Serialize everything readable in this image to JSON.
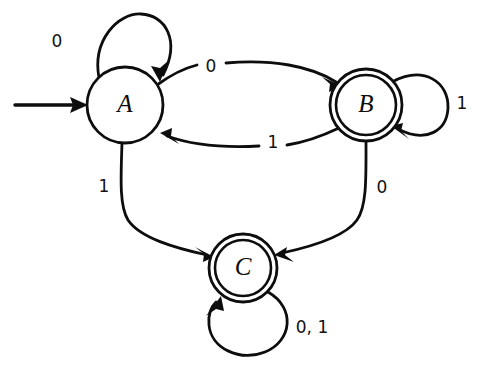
{
  "diagram": {
    "kind": "finite-state-machine",
    "alphabet": [
      "0",
      "1"
    ],
    "start_state": "A",
    "accepting_states": [
      "B",
      "C"
    ],
    "states": [
      {
        "id": "A",
        "label": "A",
        "accepting": false,
        "cx": 125,
        "cy": 105,
        "r": 38
      },
      {
        "id": "B",
        "label": "B",
        "accepting": true,
        "cx": 366,
        "cy": 105,
        "r": 36,
        "r_inner": 30
      },
      {
        "id": "C",
        "label": "C",
        "accepting": true,
        "cx": 243,
        "cy": 268,
        "r": 34,
        "r_inner": 28
      }
    ],
    "transitions": [
      {
        "from": "A",
        "to": "A",
        "label": "0",
        "label_x": 57,
        "label_y": 42
      },
      {
        "from": "A",
        "to": "B",
        "label": "0",
        "label_x": 211,
        "label_y": 67
      },
      {
        "from": "B",
        "to": "A",
        "label": "1",
        "label_x": 273,
        "label_y": 143
      },
      {
        "from": "B",
        "to": "B",
        "label": "1",
        "label_x": 462,
        "label_y": 104
      },
      {
        "from": "A",
        "to": "C",
        "label": "1",
        "label_x": 104,
        "label_y": 187
      },
      {
        "from": "B",
        "to": "C",
        "label": "0",
        "label_x": 382,
        "label_y": 188
      },
      {
        "from": "C",
        "to": "C",
        "label": "0, 1",
        "label_x": 312,
        "label_y": 328
      }
    ],
    "start_arrow": {
      "x1": 15,
      "y1": 105,
      "x2": 87,
      "y2": 105
    },
    "colors": {
      "ink": "#0d0d0d",
      "background": "#ffffff"
    },
    "stroke_width": 2.6
  }
}
